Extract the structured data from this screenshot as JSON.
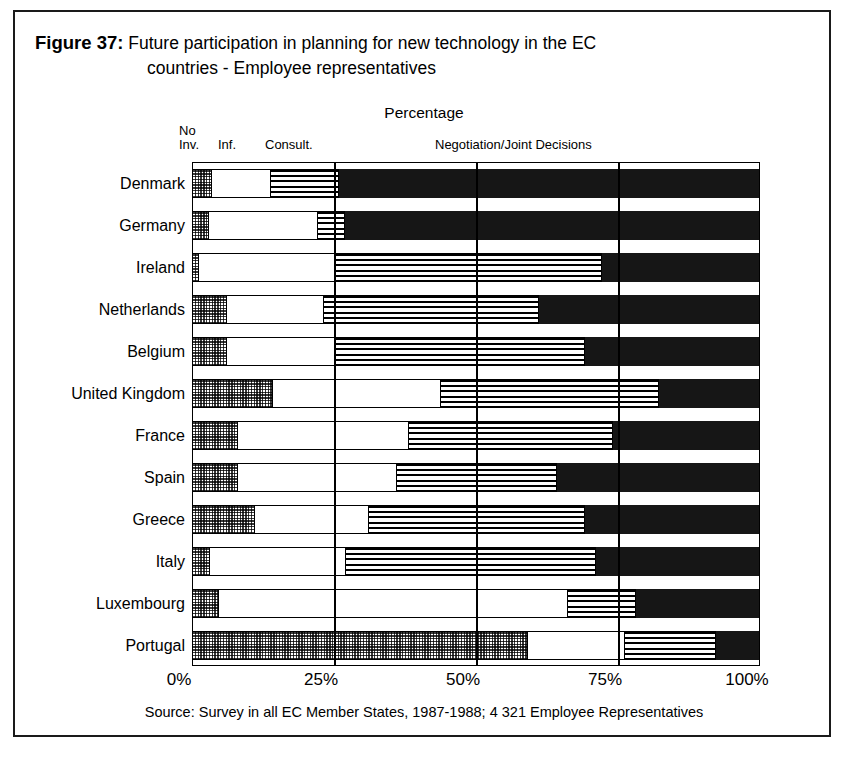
{
  "figure": {
    "number_label": "Figure 37:",
    "title_line1": "Future participation in planning for new technology in the EC",
    "title_line2": "countries - Employee representatives",
    "axis_header": "Percentage",
    "source": "Source: Survey in all EC Member States, 1987-1988; 4 321 Employee Representatives"
  },
  "legend": {
    "no_involvement": "No\nInv.",
    "information": "Inf.",
    "consultation": "Consult.",
    "negotiation": "Negotiation/Joint Decisions"
  },
  "chart_data": {
    "type": "bar",
    "orientation": "horizontal",
    "stacked": true,
    "normalized": true,
    "title": "Figure 37: Future participation in planning for new technology in the EC countries - Employee representatives",
    "subtitle": "Percentage",
    "xlabel": "Percentage",
    "ylabel": "",
    "xlim": [
      0,
      100
    ],
    "xticks": [
      0,
      25,
      50,
      75,
      100
    ],
    "xticklabels": [
      "0%",
      "25%",
      "50%",
      "75%",
      "100%"
    ],
    "grid": true,
    "legend_position": "top",
    "categories": [
      "Denmark",
      "Germany",
      "Ireland",
      "Netherlands",
      "Belgium",
      "United Kingdom",
      "France",
      "Spain",
      "Greece",
      "Italy",
      "Luxembourg",
      "Portugal"
    ],
    "series": [
      {
        "name": "No Inv.",
        "pattern": "checkered",
        "color": "#8f8f8f",
        "values": [
          3.3,
          2.8,
          1.0,
          6.0,
          6.0,
          14.0,
          8.0,
          8.0,
          11.0,
          3.0,
          4.5,
          59.0
        ]
      },
      {
        "name": "Inf.",
        "pattern": "white",
        "color": "#ffffff",
        "values": [
          10.4,
          19.2,
          24.0,
          17.0,
          19.0,
          29.7,
          30.0,
          28.0,
          20.0,
          24.0,
          61.5,
          17.0
        ]
      },
      {
        "name": "Consult.",
        "pattern": "horizontal-stripes",
        "color": "#000000",
        "values": [
          12.0,
          4.7,
          47.0,
          38.0,
          44.0,
          38.3,
          36.0,
          28.0,
          38.0,
          44.0,
          12.0,
          16.0
        ]
      },
      {
        "name": "Negotiation/Joint Decisions",
        "pattern": "solid-black",
        "color": "#161616",
        "values": [
          74.3,
          73.3,
          28.0,
          39.0,
          31.0,
          18.0,
          26.0,
          36.0,
          31.0,
          29.0,
          22.0,
          8.0
        ]
      }
    ]
  }
}
